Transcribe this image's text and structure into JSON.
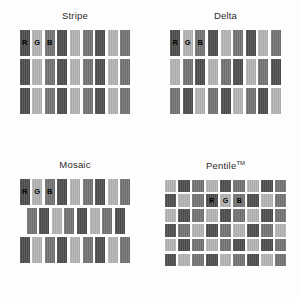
{
  "figure": {
    "background": "#fdfdfd"
  },
  "palette": {
    "R": "#4d4d4d",
    "G": "#b3b3b3",
    "B": "#737373",
    "label_on_dark": "#000000",
    "label_on_light": "#000000"
  },
  "panels": [
    {
      "key": "stripe",
      "title": "Stripe",
      "type": "bars",
      "rows": [
        {
          "cells": [
            "R",
            "G",
            "B",
            "R",
            "G",
            "B",
            "R",
            "G",
            "B"
          ],
          "labels": [
            "R",
            "G",
            "B",
            "",
            "",
            "",
            "",
            "",
            ""
          ],
          "indent": 0
        },
        {
          "cells": [
            "R",
            "G",
            "B",
            "R",
            "G",
            "B",
            "R",
            "G",
            "B"
          ],
          "labels": [
            "",
            "",
            "",
            "",
            "",
            "",
            "",
            "",
            ""
          ],
          "indent": 0
        },
        {
          "cells": [
            "R",
            "G",
            "B",
            "R",
            "G",
            "B",
            "R",
            "G",
            "B"
          ],
          "labels": [
            "",
            "",
            "",
            "",
            "",
            "",
            "",
            "",
            ""
          ],
          "indent": 0
        }
      ]
    },
    {
      "key": "delta",
      "title": "Delta",
      "type": "bars",
      "rows": [
        {
          "cells": [
            "R",
            "G",
            "B",
            "R",
            "G",
            "B",
            "R",
            "G",
            "B"
          ],
          "labels": [
            "R",
            "G",
            "B",
            "",
            "",
            "",
            "",
            "",
            ""
          ],
          "indent": 0
        },
        {
          "cells": [
            "G",
            "B",
            "R",
            "G",
            "B",
            "R",
            "G",
            "B",
            "R"
          ],
          "labels": [
            "",
            "",
            "",
            "",
            "",
            "",
            "",
            "",
            ""
          ],
          "indent": 0
        },
        {
          "cells": [
            "B",
            "R",
            "G",
            "B",
            "R",
            "G",
            "B",
            "R",
            "G"
          ],
          "labels": [
            "",
            "",
            "",
            "",
            "",
            "",
            "",
            "",
            ""
          ],
          "indent": 0
        }
      ]
    },
    {
      "key": "mosaic",
      "title": "Mosaic",
      "type": "bars",
      "rows": [
        {
          "cells": [
            "R",
            "G",
            "B",
            "R",
            "G",
            "B",
            "R",
            "G",
            "B"
          ],
          "labels": [
            "R",
            "G",
            "B",
            "",
            "",
            "",
            "",
            "",
            ""
          ],
          "indent": 0
        },
        {
          "cells": [
            "B",
            "R",
            "G",
            "B",
            "R",
            "G",
            "B",
            "R"
          ],
          "labels": [
            "",
            "",
            "",
            "",
            "",
            "",
            "",
            ""
          ],
          "indent": 7
        },
        {
          "cells": [
            "R",
            "G",
            "B",
            "R",
            "G",
            "B",
            "R",
            "G",
            "B"
          ],
          "labels": [
            "",
            "",
            "",
            "",
            "",
            "",
            "",
            "",
            ""
          ],
          "indent": 0
        }
      ]
    },
    {
      "key": "pentile",
      "title": "Pentile",
      "title_suffix": "TM",
      "type": "cells",
      "rows": [
        {
          "cells": [
            "G",
            "R",
            "B",
            "G",
            "R",
            "B",
            "G",
            "R",
            "B"
          ],
          "labels": [
            "",
            "",
            "",
            "",
            "",
            "",
            "",
            "",
            ""
          ]
        },
        {
          "cells": [
            "R",
            "G",
            "B",
            "R",
            "G",
            "B",
            "R",
            "G",
            "B"
          ],
          "labels": [
            "",
            "",
            "",
            "R",
            "G",
            "B",
            "",
            "",
            ""
          ]
        },
        {
          "cells": [
            "G",
            "R",
            "B",
            "G",
            "R",
            "B",
            "G",
            "R",
            "B"
          ],
          "labels": [
            "",
            "",
            "",
            "",
            "",
            "",
            "",
            "",
            ""
          ]
        },
        {
          "cells": [
            "R",
            "B",
            "G",
            "R",
            "B",
            "G",
            "R",
            "B",
            "G"
          ],
          "labels": [
            "",
            "",
            "",
            "",
            "",
            "",
            "",
            "",
            ""
          ]
        },
        {
          "cells": [
            "G",
            "R",
            "B",
            "G",
            "B",
            "R",
            "G",
            "R",
            "B"
          ],
          "labels": [
            "",
            "",
            "",
            "",
            "",
            "",
            "",
            "",
            ""
          ]
        },
        {
          "cells": [
            "R",
            "G",
            "B",
            "R",
            "G",
            "B",
            "R",
            "G",
            "B"
          ],
          "labels": [
            "",
            "",
            "",
            "",
            "",
            "",
            "",
            "",
            ""
          ]
        }
      ]
    }
  ]
}
